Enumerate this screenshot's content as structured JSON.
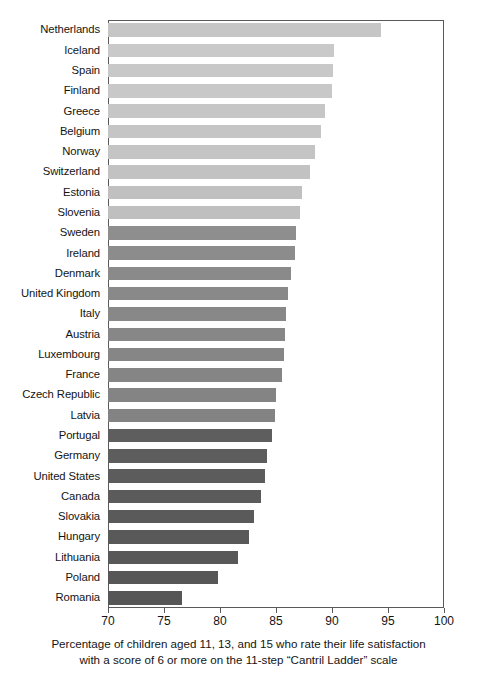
{
  "chart_data": {
    "type": "bar",
    "orientation": "horizontal",
    "title": "",
    "subtitle": "",
    "xlabel": "Percentage of children aged 11, 13, and 15 who rate their life satisfaction with a score of 6 or more on the 11-step \"Cantril Ladder\" scale",
    "ylabel": "",
    "xlim": [
      70,
      100
    ],
    "xticks": [
      70,
      75,
      80,
      85,
      90,
      95,
      100
    ],
    "xtick_labels": [
      "70",
      "75",
      "80",
      "85",
      "90",
      "95",
      "100"
    ],
    "grid": false,
    "legend": false,
    "categories": [
      "Netherlands",
      "Iceland",
      "Spain",
      "Finland",
      "Greece",
      "Belgium",
      "Norway",
      "Switzerland",
      "Estonia",
      "Slovenia",
      "Sweden",
      "Ireland",
      "Denmark",
      "United Kingdom",
      "Italy",
      "Austria",
      "Luxembourg",
      "France",
      "Czech Republic",
      "Latvia",
      "Portugal",
      "Germany",
      "United States",
      "Canada",
      "Slovakia",
      "Hungary",
      "Lithuania",
      "Poland",
      "Romania"
    ],
    "values": [
      94.4,
      90.2,
      90.1,
      90.0,
      89.4,
      89.0,
      88.5,
      88.0,
      87.3,
      87.1,
      86.8,
      86.7,
      86.3,
      86.1,
      85.9,
      85.8,
      85.7,
      85.5,
      85.0,
      84.9,
      84.6,
      84.2,
      84.0,
      83.7,
      83.0,
      82.6,
      81.6,
      79.8,
      76.6
    ],
    "bar_colors": [
      "#c6c6c6",
      "#c9c9c9",
      "#c8c8c8",
      "#c8c8c8",
      "#c6c6c6",
      "#c5c5c5",
      "#c4c4c4",
      "#c2c2c2",
      "#c0c0c0",
      "#bfbfbf",
      "#8e8e8e",
      "#8c8c8c",
      "#8a8a8a",
      "#898989",
      "#888888",
      "#878787",
      "#868686",
      "#858585",
      "#848484",
      "#838383",
      "#5e5e5e",
      "#5d5d5d",
      "#5c5c5c",
      "#5b5b5b",
      "#5a5a5a",
      "#595959",
      "#585858",
      "#575757",
      "#565656"
    ]
  },
  "caption": {
    "line1": "Percentage of children aged 11, 13, and 15 who rate their life satisfaction",
    "line2": "with a score of 6 or more on the 11-step “Cantril Ladder” scale"
  },
  "colors": {
    "axis": "#5a5a5a",
    "text": "#141414",
    "background": "#ffffff"
  }
}
